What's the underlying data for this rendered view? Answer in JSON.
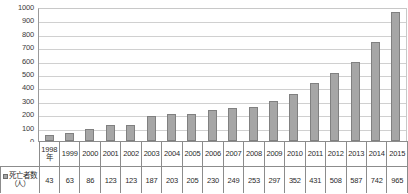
{
  "chart_data": {
    "type": "bar",
    "title": "",
    "xlabel": "",
    "ylabel": "",
    "ylim": [
      0,
      1000
    ],
    "ytick_step": 100,
    "grid": true,
    "legend_position": "table-row-header",
    "bar_color": "#a6a6a6",
    "bar_border_color": "#808080",
    "gridline_color": "#d0d0d0",
    "axis_color": "#9a9a9a",
    "categories": [
      "1998年",
      "1999",
      "2000",
      "2001",
      "2002",
      "2003",
      "2004",
      "2005",
      "2006",
      "2007",
      "2008",
      "2009",
      "2010",
      "2011",
      "2012",
      "2013",
      "2014",
      "2015"
    ],
    "first_category_line1": "1998",
    "first_category_line2": "年",
    "series": [
      {
        "name": "死亡者数（人）",
        "values": [
          43,
          63,
          86,
          123,
          123,
          187,
          203,
          205,
          230,
          249,
          253,
          297,
          352,
          431,
          508,
          587,
          742,
          965
        ]
      }
    ],
    "ytick_labels": [
      "1000",
      "900",
      "800",
      "700",
      "600",
      "500",
      "400",
      "300",
      "200",
      "100",
      "0"
    ]
  },
  "table": {
    "series_label_line1": "死亡者数",
    "series_label_line2": "（人）",
    "legend_marker": "square-swatch-icon"
  }
}
